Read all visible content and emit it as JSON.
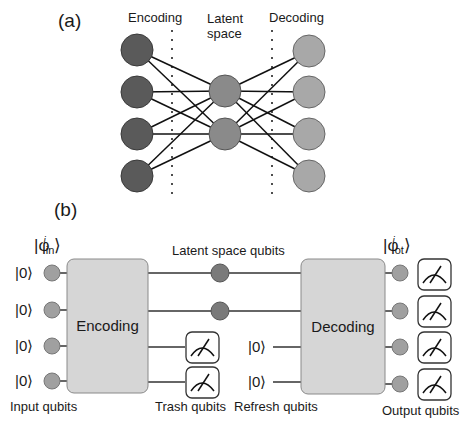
{
  "panel_a": {
    "label": "(a)",
    "headers": {
      "encoding": "Encoding",
      "latent_line1": "Latent",
      "latent_line2": "space",
      "decoding": "Decoding"
    },
    "layers": {
      "input_nodes": 4,
      "latent_nodes": 2,
      "output_nodes": 4
    },
    "colors": {
      "input_node": "#5a5a5a",
      "latent_node": "#8a8a8a",
      "output_node": "#a8a8a8",
      "edge": "#111111"
    }
  },
  "panel_b": {
    "label": "(b)",
    "input_state": {
      "symbol": "|φ",
      "sub": "in",
      "sup": "i",
      "close": "⟩"
    },
    "output_state": {
      "symbol": "|φ",
      "sub": "ot",
      "sup": "i",
      "close": "⟩"
    },
    "input_kets": [
      "|0⟩",
      "|0⟩",
      "|0⟩",
      "|0⟩"
    ],
    "refresh_kets": [
      "|0⟩",
      "|0⟩"
    ],
    "encoding_box": "Encoding",
    "decoding_box": "Decoding",
    "latent_label": "Latent space qubits",
    "bottom_labels": {
      "input": "Input qubits",
      "trash": "Trash qubits",
      "refresh": "Refresh qubits",
      "output": "Output qubits"
    },
    "colors": {
      "box_fill": "#d6d6d6",
      "qubit_dot": "#a0a0a0",
      "latent_dot": "#7a7a7a",
      "wire": "#333333"
    }
  }
}
